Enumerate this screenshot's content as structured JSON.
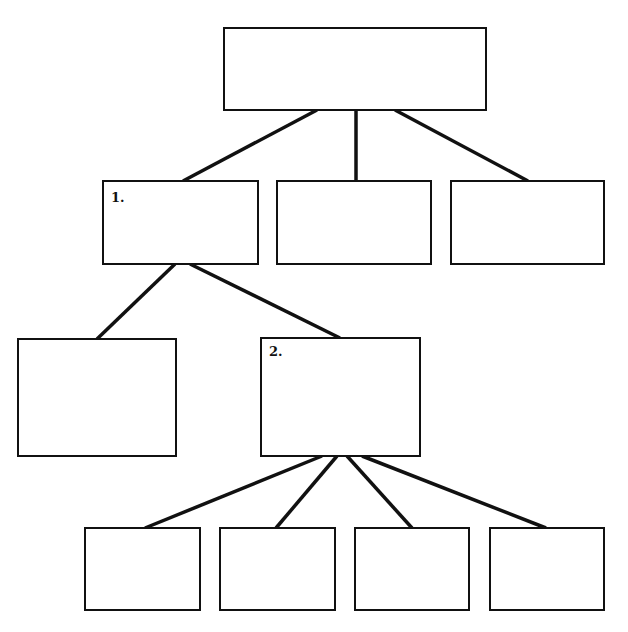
{
  "diagram": {
    "type": "tree",
    "nodes": [
      {
        "id": "root",
        "label": ""
      },
      {
        "id": "l1-a",
        "label": "1."
      },
      {
        "id": "l1-b",
        "label": ""
      },
      {
        "id": "l1-c",
        "label": ""
      },
      {
        "id": "l2-a",
        "label": ""
      },
      {
        "id": "l2-b",
        "label": "2."
      },
      {
        "id": "l3-a",
        "label": ""
      },
      {
        "id": "l3-b",
        "label": ""
      },
      {
        "id": "l3-c",
        "label": ""
      },
      {
        "id": "l3-d",
        "label": ""
      }
    ],
    "edges": [
      {
        "from": "root",
        "to": "l1-a"
      },
      {
        "from": "root",
        "to": "l1-b"
      },
      {
        "from": "root",
        "to": "l1-c"
      },
      {
        "from": "l1-a",
        "to": "l2-a"
      },
      {
        "from": "l1-a",
        "to": "l2-b"
      },
      {
        "from": "l2-b",
        "to": "l3-a"
      },
      {
        "from": "l2-b",
        "to": "l3-b"
      },
      {
        "from": "l2-b",
        "to": "l3-c"
      },
      {
        "from": "l2-b",
        "to": "l3-d"
      }
    ]
  }
}
